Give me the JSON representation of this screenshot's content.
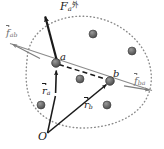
{
  "figure": {
    "width": 164,
    "height": 149,
    "background": "#ffffff"
  },
  "colors": {
    "ink": "#1a1a1a",
    "gray_line": "#7d7d7d",
    "boundary_dot": "#8a8a8a",
    "particle_fill": "#6a6a6a",
    "particle_edge": "#3c3c3c",
    "background": "#ffffff"
  },
  "labels": {
    "external_force": {
      "symbol": "F",
      "sub": "a",
      "sup": "外",
      "vector": true,
      "color": "#1a1a1a"
    },
    "internal_force_ab": {
      "symbol": "f",
      "sub": "ab",
      "sup": "",
      "vector": true,
      "color": "#6f6f6f"
    },
    "internal_force_ba": {
      "symbol": "f",
      "sub": "ba",
      "sup": "",
      "vector": true,
      "color": "#6f6f6f"
    },
    "point_a": {
      "symbol": "a"
    },
    "point_b": {
      "symbol": "b"
    },
    "position_a": {
      "symbol": "r",
      "sub": "a",
      "vector": true
    },
    "position_b": {
      "symbol": "r",
      "sub": "b",
      "vector": true
    },
    "origin": {
      "symbol": "O"
    }
  },
  "geometry": {
    "origin_point": {
      "x": 47,
      "y": 133
    },
    "particle_a": {
      "x": 56,
      "y": 63,
      "r": 4.2
    },
    "particle_b": {
      "x": 110,
      "y": 81,
      "r": 4.2
    },
    "external_force_arrow": {
      "x1": 57,
      "y1": 63,
      "x2": 44,
      "y2": 13
    },
    "internal_force_ab_arrow": {
      "x1": 56,
      "y1": 63,
      "x2": 12,
      "y2": 44
    },
    "internal_force_ba_arrow": {
      "x1": 110,
      "y1": 81,
      "x2": 150,
      "y2": 90
    },
    "position_a_arrow": {
      "x1": 47,
      "y1": 133,
      "x2": 55,
      "y2": 68
    },
    "position_b_arrow": {
      "x1": 47,
      "y1": 133,
      "x2": 107,
      "y2": 85
    },
    "connector_dashed": {
      "x1": 58,
      "y1": 64,
      "x2": 108,
      "y2": 80
    },
    "small_up_arrow_at_a": {
      "x1": 57,
      "y1": 78,
      "x2": 57,
      "y2": 68
    },
    "boundary_path": "M 27,60 C 28,36 46,21 71,17 C 97,13 124,24 140,45 C 153,62 155,85 145,101 C 134,119 108,128 83,128 C 58,128 36,117 29,96 C 25,83 26,70 27,60 Z",
    "particles": [
      {
        "x": 93,
        "y": 34,
        "r": 4.0
      },
      {
        "x": 132,
        "y": 51,
        "r": 4.0
      },
      {
        "x": 80,
        "y": 79,
        "r": 4.0
      },
      {
        "x": 41,
        "y": 105,
        "r": 4.0
      },
      {
        "x": 107,
        "y": 105,
        "r": 4.0
      }
    ]
  }
}
